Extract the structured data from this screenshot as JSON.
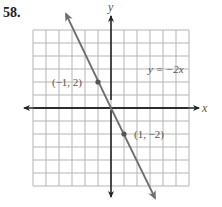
{
  "problem_number": "58.",
  "chart_data": {
    "type": "line",
    "title": "",
    "xlabel": "x",
    "ylabel": "y",
    "xlim": [
      -6,
      6
    ],
    "ylim": [
      -6,
      6
    ],
    "grid": true,
    "grid_step": 1,
    "series": [
      {
        "name": "y = −2x",
        "equation": "y = -2x",
        "slope": -2,
        "intercept": 0,
        "x": [
          -3.9,
          4.1
        ],
        "y": [
          7.8,
          -8.2
        ]
      }
    ],
    "points": [
      {
        "x": -1,
        "y": 2,
        "label": "(−1, 2)"
      },
      {
        "x": 1,
        "y": -2,
        "label": "(1, −2)"
      }
    ],
    "annotations": [
      {
        "text": "y = −2x",
        "x": 2.3,
        "y": 3.2
      }
    ]
  },
  "labels": {
    "x_axis": "x",
    "y_axis": "y",
    "equation": "y = −2x",
    "point1": "(−1, 2)",
    "point2": "(1, −2)"
  },
  "colors": {
    "grid": "#b5b5b5",
    "axis": "#222222",
    "line": "#6e6e6e",
    "point": "#555555",
    "text": "#555555"
  }
}
